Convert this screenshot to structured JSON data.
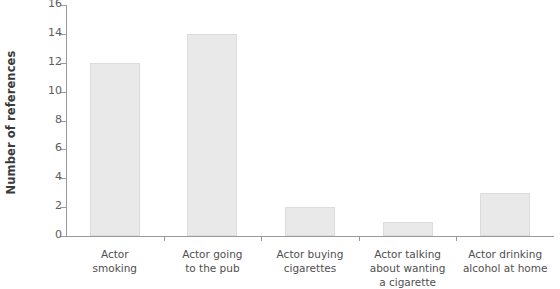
{
  "chart_data": {
    "type": "bar",
    "title": "",
    "xlabel": "",
    "ylabel": "Number of references",
    "categories": [
      "Actor\nsmoking",
      "Actor going\nto the pub",
      "Actor buying\ncigarettes",
      "Actor talking\nabout wanting\na cigarette",
      "Actor drinking\nalcohol at home"
    ],
    "values": [
      12,
      14,
      2,
      1,
      3
    ],
    "ylim": [
      0,
      16
    ],
    "yticks": [
      0,
      2,
      4,
      6,
      8,
      10,
      12,
      14,
      16
    ],
    "ytick_labels": [
      "0",
      "2",
      "4",
      "6",
      "8",
      "10",
      "12",
      "14",
      "16"
    ],
    "grid": false,
    "legend": "none",
    "colors": {
      "bar_fill": "#e9e9e9",
      "bar_border": "#dcdcdc",
      "axis": "#9a9a9a",
      "tick_text": "#5d5d5d",
      "category_text": "#4f4f4f",
      "axis_title_text": "#3a3a3a",
      "background": "#ffffff"
    }
  }
}
